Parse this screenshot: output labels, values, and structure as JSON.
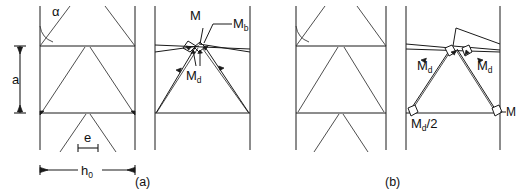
{
  "figure": {
    "background_color": "#ffffff",
    "line_color": "#1a1a1a",
    "captions": [
      {
        "id": "caption-a",
        "text": "(a)"
      },
      {
        "id": "caption-b",
        "text": "(b)"
      }
    ],
    "panels": [
      {
        "id": "panel-a",
        "caption": "(a)",
        "geometry_diagram": {
          "id": "panel-a-geometry",
          "labels": [
            {
              "name": "angle-alpha",
              "text": "α"
            },
            {
              "name": "dimension-a",
              "text": "a"
            },
            {
              "name": "dimension-e",
              "text": "e"
            },
            {
              "name": "dimension-h0",
              "text": "h",
              "subscript": "0"
            }
          ]
        },
        "vector_diagram": {
          "id": "panel-a-vectors",
          "labels": [
            {
              "name": "moment-M",
              "text": "M",
              "subscript": ""
            },
            {
              "name": "moment-Mb",
              "text": "M",
              "subscript": "b"
            },
            {
              "name": "moment-Md",
              "text": "M",
              "subscript": "d"
            }
          ]
        }
      },
      {
        "id": "panel-b",
        "caption": "(b)",
        "geometry_diagram": {
          "id": "panel-b-geometry",
          "labels": []
        },
        "vector_diagram": {
          "id": "panel-b-vectors",
          "labels": [
            {
              "name": "moment-Md-left",
              "text": "M",
              "subscript": "d"
            },
            {
              "name": "moment-Md-right",
              "text": "M",
              "subscript": "d"
            },
            {
              "name": "moment-Md-half",
              "text": "M",
              "subscript": "d",
              "suffix": "/2"
            },
            {
              "name": "moment-M-right",
              "text": "M",
              "subscript": ""
            }
          ]
        }
      }
    ],
    "label_text": {
      "alpha": "α",
      "a": "a",
      "e": "e",
      "h": "h",
      "h_sub": "0",
      "M": "M",
      "M_b_base": "M",
      "M_b_sub": "b",
      "M_d_base": "M",
      "M_d_sub": "d",
      "half_suffix": "/2",
      "caption_a": "(a)",
      "caption_b": "(b)"
    }
  }
}
